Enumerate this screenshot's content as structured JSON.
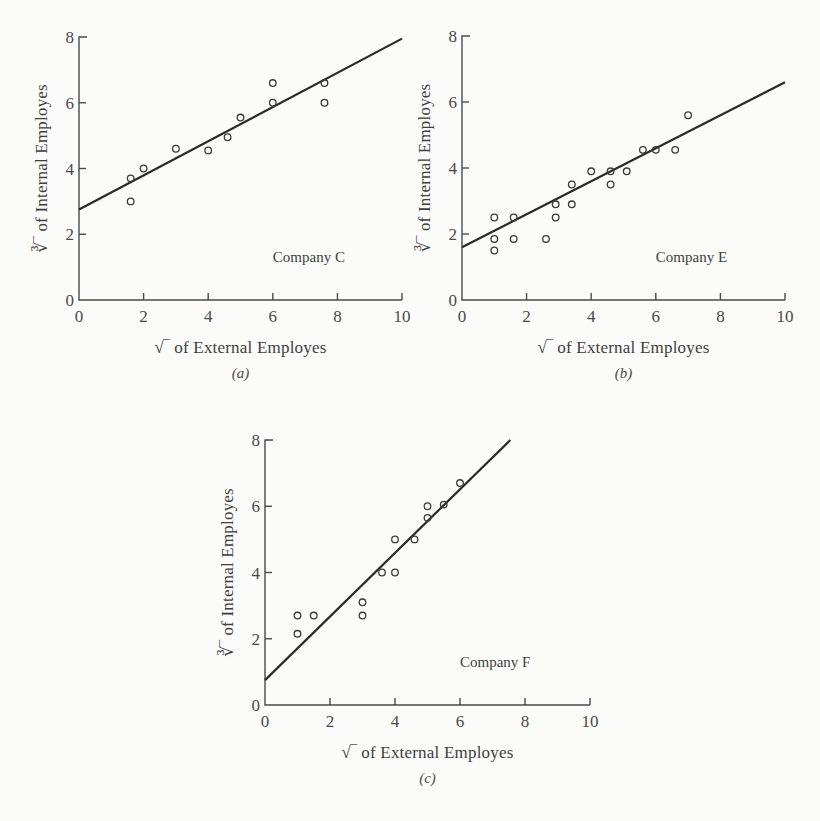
{
  "chart_data": [
    {
      "id": "a",
      "type": "scatter",
      "caption": "(a)",
      "title": "Company C",
      "xlabel": "√‾ of External Employes",
      "ylabel": "∛‾ of Internal Employes",
      "xlim": [
        0,
        10
      ],
      "ylim": [
        0,
        8
      ],
      "xticks": [
        0,
        2,
        4,
        6,
        8,
        10
      ],
      "yticks": [
        0,
        2,
        4,
        6,
        8
      ],
      "grid": false,
      "points": [
        [
          1.6,
          3.7
        ],
        [
          1.6,
          3.0
        ],
        [
          2.0,
          4.0
        ],
        [
          3.0,
          4.6
        ],
        [
          4.0,
          4.55
        ],
        [
          4.6,
          4.95
        ],
        [
          5.0,
          5.55
        ],
        [
          6.0,
          6.6
        ],
        [
          6.0,
          6.0
        ],
        [
          7.6,
          6.6
        ],
        [
          7.6,
          6.0
        ]
      ],
      "fit_line": [
        [
          0,
          2.75
        ],
        [
          10,
          7.95
        ]
      ],
      "frame": {
        "left": 79,
        "top": 37,
        "width": 323,
        "height": 263
      }
    },
    {
      "id": "b",
      "type": "scatter",
      "caption": "(b)",
      "title": "Company E",
      "xlabel": "√‾ of External Employes",
      "ylabel": "∛‾ of Internal Employes",
      "xlim": [
        0,
        10
      ],
      "ylim": [
        0,
        8
      ],
      "xticks": [
        0,
        2,
        4,
        6,
        8,
        10
      ],
      "yticks": [
        0,
        2,
        4,
        6,
        8
      ],
      "grid": false,
      "points": [
        [
          1.0,
          2.5
        ],
        [
          1.0,
          1.85
        ],
        [
          1.0,
          1.5
        ],
        [
          1.6,
          2.5
        ],
        [
          1.6,
          1.85
        ],
        [
          2.6,
          1.85
        ],
        [
          2.9,
          2.9
        ],
        [
          2.9,
          2.5
        ],
        [
          3.4,
          3.5
        ],
        [
          3.4,
          2.9
        ],
        [
          4.0,
          3.9
        ],
        [
          4.6,
          3.9
        ],
        [
          4.6,
          3.5
        ],
        [
          5.1,
          3.9
        ],
        [
          5.6,
          4.55
        ],
        [
          6.0,
          4.55
        ],
        [
          6.6,
          4.55
        ],
        [
          7.0,
          5.6
        ]
      ],
      "fit_line": [
        [
          0,
          1.6
        ],
        [
          10,
          6.6
        ]
      ],
      "frame": {
        "left": 462,
        "top": 36,
        "width": 323,
        "height": 264
      }
    },
    {
      "id": "c",
      "type": "scatter",
      "caption": "(c)",
      "title": "Company F",
      "xlabel": "√‾ of External Employes",
      "ylabel": "∛‾ of Internal Employes",
      "xlim": [
        0,
        10
      ],
      "ylim": [
        0,
        8
      ],
      "xticks": [
        0,
        2,
        4,
        6,
        8,
        10
      ],
      "yticks": [
        0,
        2,
        4,
        6,
        8
      ],
      "grid": false,
      "points": [
        [
          1.0,
          2.7
        ],
        [
          1.0,
          2.15
        ],
        [
          1.5,
          2.7
        ],
        [
          3.0,
          3.1
        ],
        [
          3.0,
          2.7
        ],
        [
          3.6,
          4.0
        ],
        [
          4.0,
          5.0
        ],
        [
          4.0,
          4.0
        ],
        [
          4.6,
          5.0
        ],
        [
          5.0,
          6.0
        ],
        [
          5.0,
          5.65
        ],
        [
          5.5,
          6.05
        ],
        [
          6.0,
          6.7
        ]
      ],
      "fit_line": [
        [
          0,
          0.75
        ],
        [
          7.55,
          8.0
        ]
      ],
      "frame": {
        "left": 265,
        "top": 440,
        "width": 325,
        "height": 265
      }
    }
  ]
}
